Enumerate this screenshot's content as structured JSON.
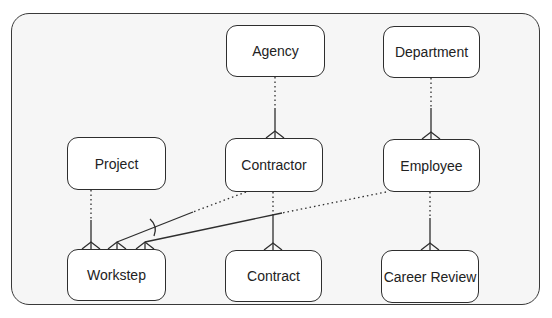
{
  "diagram": {
    "type": "entity-relationship",
    "entities": [
      {
        "id": "agency",
        "label": "Agency",
        "x": 226,
        "y": 25,
        "w": 99,
        "h": 52
      },
      {
        "id": "department",
        "label": "Department",
        "x": 383,
        "y": 26,
        "w": 97,
        "h": 52
      },
      {
        "id": "project",
        "label": "Project",
        "x": 67,
        "y": 137,
        "w": 99,
        "h": 53
      },
      {
        "id": "contractor",
        "label": "Contractor",
        "x": 225,
        "y": 138,
        "w": 98,
        "h": 54
      },
      {
        "id": "employee",
        "label": "Employee",
        "x": 383,
        "y": 139,
        "w": 97,
        "h": 53
      },
      {
        "id": "workstep",
        "label": "Workstep",
        "x": 67,
        "y": 249,
        "w": 99,
        "h": 52
      },
      {
        "id": "contract",
        "label": "Contract",
        "x": 225,
        "y": 250,
        "w": 97,
        "h": 52
      },
      {
        "id": "career_review",
        "label": "Career Review",
        "x": 381,
        "y": 250,
        "w": 98,
        "h": 53
      }
    ],
    "relationships": [
      {
        "from": "agency",
        "to": "contractor",
        "cardinality": "one-to-many",
        "parent_optional": true
      },
      {
        "from": "department",
        "to": "employee",
        "cardinality": "one-to-many",
        "parent_optional": true
      },
      {
        "from": "project",
        "to": "workstep",
        "cardinality": "one-to-many",
        "parent_optional": true
      },
      {
        "from": "contractor",
        "to": "contract",
        "cardinality": "one-to-many",
        "parent_optional": true
      },
      {
        "from": "employee",
        "to": "career_review",
        "cardinality": "one-to-many",
        "parent_optional": true
      },
      {
        "from": "contractor",
        "to": "workstep",
        "cardinality": "one-to-many",
        "parent_optional": true,
        "exclusive_arc": true
      },
      {
        "from": "employee",
        "to": "workstep",
        "cardinality": "one-to-many",
        "parent_optional": true,
        "exclusive_arc": true
      }
    ],
    "colors": {
      "line": "#2e2e2e",
      "frame_bg": "#f6f6f6",
      "entity_bg": "#ffffff"
    }
  }
}
